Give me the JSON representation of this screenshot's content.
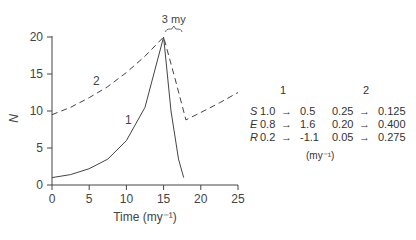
{
  "chart_data": {
    "type": "line",
    "title": "",
    "xlabel": "Time (my⁻¹)",
    "ylabel": "N",
    "xlim": [
      0,
      25
    ],
    "ylim": [
      0,
      20
    ],
    "xticks": [
      0,
      5,
      10,
      15,
      20,
      25
    ],
    "yticks": [
      0,
      5,
      10,
      15,
      20
    ],
    "grid": false,
    "annotations": [
      {
        "text": "3 my",
        "x": 15.7,
        "y": 20.5,
        "note": "brace spanning peak to drop"
      }
    ],
    "series": [
      {
        "name": "1",
        "style": "solid",
        "x": [
          0,
          2.5,
          5,
          7.5,
          10,
          12.5,
          15,
          16,
          17,
          17.7
        ],
        "y": [
          1.0,
          1.4,
          2.2,
          3.5,
          6.0,
          10.5,
          20.0,
          10.0,
          3.5,
          1.0
        ]
      },
      {
        "name": "2",
        "style": "dashed",
        "x": [
          0,
          2.5,
          5,
          7.5,
          10,
          12.5,
          15,
          16.5,
          18,
          20,
          22.5,
          25
        ],
        "y": [
          9.5,
          10.5,
          11.8,
          13.3,
          15.2,
          17.4,
          20.0,
          14.5,
          8.8,
          9.8,
          11.1,
          12.5
        ]
      }
    ]
  },
  "axes": {
    "y_label": "N",
    "x_label": "Time (my⁻¹)",
    "x_ticks": [
      "0",
      "5",
      "10",
      "15",
      "20",
      "25"
    ],
    "y_ticks": [
      "0",
      "5",
      "10",
      "15",
      "20"
    ],
    "series_labels": [
      "1",
      "2"
    ],
    "brace_label": "3 my"
  },
  "table": {
    "headers": [
      "1",
      "2"
    ],
    "rows": [
      {
        "param": "S",
        "c1_from": "1.0",
        "c1_to": "0.5",
        "c2_from": "0.25",
        "c2_to": "0.125"
      },
      {
        "param": "E",
        "c1_from": "0.8",
        "c1_to": "1.6",
        "c2_from": "0.20",
        "c2_to": "0.400"
      },
      {
        "param": "R",
        "c1_from": "0.2",
        "c1_to": "-1.1",
        "c2_from": "0.05",
        "c2_to": "0.275"
      }
    ],
    "unit": "(my⁻¹)"
  }
}
